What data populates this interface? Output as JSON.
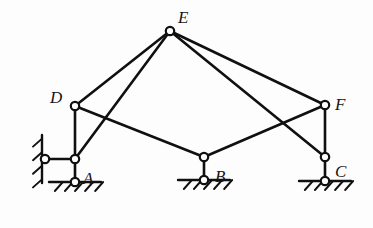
{
  "diagram": {
    "type": "structural-mechanism-diagram",
    "stroke_color": "#101010",
    "background_color": "#fdfdfd",
    "canvas": {
      "width": 373,
      "height": 228
    },
    "member_stroke_width": 2.6,
    "joint_radius": 4.2,
    "joint_fill": "#ffffff",
    "labels": [
      {
        "id": "label-E",
        "text": "E",
        "x": 178,
        "y": 9
      },
      {
        "id": "label-D",
        "text": "D",
        "x": 50,
        "y": 89
      },
      {
        "id": "label-F",
        "text": "F",
        "x": 335,
        "y": 96
      },
      {
        "id": "label-A",
        "text": "A",
        "x": 83,
        "y": 170
      },
      {
        "id": "label-B",
        "text": "B",
        "x": 215,
        "y": 168
      },
      {
        "id": "label-C",
        "text": "C",
        "x": 335,
        "y": 163
      }
    ],
    "nodes": [
      {
        "id": "E",
        "label": "E",
        "x": 170,
        "y": 31,
        "joint": true
      },
      {
        "id": "D",
        "label": "D",
        "x": 75,
        "y": 106,
        "joint": true
      },
      {
        "id": "F",
        "label": "F",
        "x": 325,
        "y": 105,
        "joint": true
      },
      {
        "id": "Aj",
        "label": "",
        "x": 75,
        "y": 159,
        "joint": true
      },
      {
        "id": "A",
        "label": "A",
        "x": 75,
        "y": 182,
        "joint": true
      },
      {
        "id": "Bj",
        "label": "",
        "x": 204,
        "y": 157,
        "joint": true
      },
      {
        "id": "B",
        "label": "B",
        "x": 204,
        "y": 180,
        "joint": true
      },
      {
        "id": "Cj",
        "label": "",
        "x": 325,
        "y": 157,
        "joint": true
      },
      {
        "id": "C",
        "label": "C",
        "x": 325,
        "y": 181,
        "joint": true
      },
      {
        "id": "W",
        "label": "",
        "x": 45,
        "y": 159,
        "joint": true
      }
    ],
    "members": [
      {
        "id": "member-E-D",
        "from": "E",
        "to": "D"
      },
      {
        "id": "member-E-Aj",
        "from": "E",
        "to": "Aj"
      },
      {
        "id": "member-E-F",
        "from": "E",
        "to": "F"
      },
      {
        "id": "member-E-Cj",
        "from": "E",
        "to": "Cj"
      },
      {
        "id": "member-D-Bj",
        "from": "D",
        "to": "Bj"
      },
      {
        "id": "member-D-Aj",
        "from": "D",
        "to": "Aj"
      },
      {
        "id": "member-Bj-F",
        "from": "Bj",
        "to": "F"
      },
      {
        "id": "member-F-Cj",
        "from": "F",
        "to": "Cj"
      },
      {
        "id": "member-Aj-A",
        "from": "Aj",
        "to": "A"
      },
      {
        "id": "member-Bj-B",
        "from": "Bj",
        "to": "B"
      },
      {
        "id": "member-Cj-C",
        "from": "Cj",
        "to": "C"
      },
      {
        "id": "member-W-Aj",
        "from": "W",
        "to": "Aj"
      }
    ],
    "supports": [
      {
        "id": "support-A",
        "kind": "ground-hatched",
        "node": "A",
        "x": 75,
        "y": 182,
        "line_half_width": 26,
        "hatch_count": 5
      },
      {
        "id": "support-B",
        "kind": "ground-hatched",
        "node": "B",
        "x": 204,
        "y": 180,
        "line_half_width": 26,
        "hatch_count": 5
      },
      {
        "id": "support-C",
        "kind": "ground-hatched",
        "node": "C",
        "x": 325,
        "y": 181,
        "line_half_width": 26,
        "hatch_count": 5
      },
      {
        "id": "support-wall-left",
        "kind": "wall-hatched-vertical",
        "node": "W",
        "x": 42,
        "y": 159,
        "line_half_height": 24,
        "hatch_count": 4
      }
    ]
  }
}
